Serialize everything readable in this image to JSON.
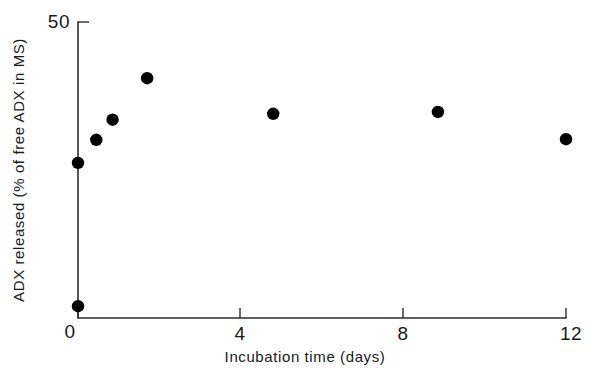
{
  "chart_data": {
    "type": "scatter",
    "title": "",
    "xlabel": "Incubation time (days)",
    "ylabel": "ADX released (% of free ADX in MS)",
    "xlim": [
      0,
      12.3
    ],
    "ylim": [
      0,
      50
    ],
    "xticks": [
      0,
      4,
      8,
      12
    ],
    "xtick_labels": [
      "0",
      "4",
      "8",
      "12"
    ],
    "yticks": [
      0,
      50
    ],
    "ytick_labels": [
      "0",
      "50"
    ],
    "grid": false,
    "legend": null,
    "marker": "filled-circle",
    "marker_color": "#000000",
    "series": [
      {
        "name": "ADX released",
        "points": [
          {
            "x": 0.0,
            "y": 2.0
          },
          {
            "x": 0.0,
            "y": 26.2
          },
          {
            "x": 0.45,
            "y": 30.1
          },
          {
            "x": 0.85,
            "y": 33.5
          },
          {
            "x": 1.7,
            "y": 40.5
          },
          {
            "x": 4.8,
            "y": 34.5
          },
          {
            "x": 8.85,
            "y": 34.8
          },
          {
            "x": 12.0,
            "y": 30.2
          }
        ]
      }
    ]
  },
  "axes": {
    "x_tick_0": "0",
    "x_tick_1": "4",
    "x_tick_2": "8",
    "x_tick_3": "12",
    "y_tick_top": "50",
    "y_tick_bottom": "0",
    "x_axis_title": "Incubation time (days)",
    "y_axis_title": "ADX released (% of free ADX in MS)"
  },
  "colors": {
    "marker": "#000000",
    "axis": "#2b2b2b",
    "background": "#ffffff",
    "text": "#1a1a1a"
  }
}
